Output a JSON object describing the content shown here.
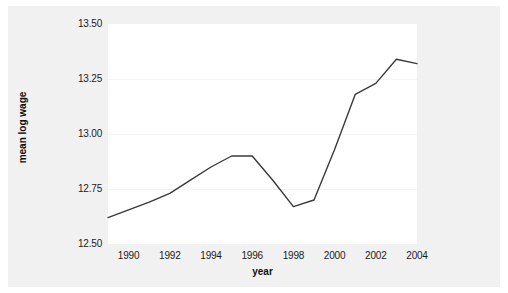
{
  "chart_data": {
    "type": "line",
    "title": "",
    "xlabel": "year",
    "ylabel": "mean log wage",
    "xlim": [
      1989,
      2004
    ],
    "ylim": [
      12.5,
      13.5
    ],
    "grid": true,
    "legend": false,
    "x_ticks": [
      "1990",
      "1992",
      "1994",
      "1996",
      "1998",
      "2000",
      "2002",
      "2004"
    ],
    "x_tick_values": [
      1990,
      1992,
      1994,
      1996,
      1998,
      2000,
      2002,
      2004
    ],
    "y_ticks": [
      "13.50",
      "13.25",
      "13.00",
      "12.75",
      "12.50"
    ],
    "y_tick_values": [
      13.5,
      13.25,
      13.0,
      12.75,
      12.5
    ],
    "line_color": "#3a3a3a",
    "line_width": 1.4,
    "series": [
      {
        "name": "mean log wage",
        "x": [
          1989,
          1990,
          1991,
          1992,
          1993,
          1994,
          1995,
          1996,
          1997,
          1998,
          1999,
          2000,
          2001,
          2002,
          2003,
          2004
        ],
        "values": [
          12.62,
          12.655,
          12.69,
          12.73,
          12.79,
          12.85,
          12.9,
          12.9,
          12.79,
          12.67,
          12.7,
          12.93,
          13.18,
          13.23,
          13.34,
          13.32
        ]
      }
    ]
  },
  "figure": {
    "background_color": "#f1f1f1",
    "plot_background_color": "#ffffff",
    "gridline_color": "#f4f4f4"
  }
}
